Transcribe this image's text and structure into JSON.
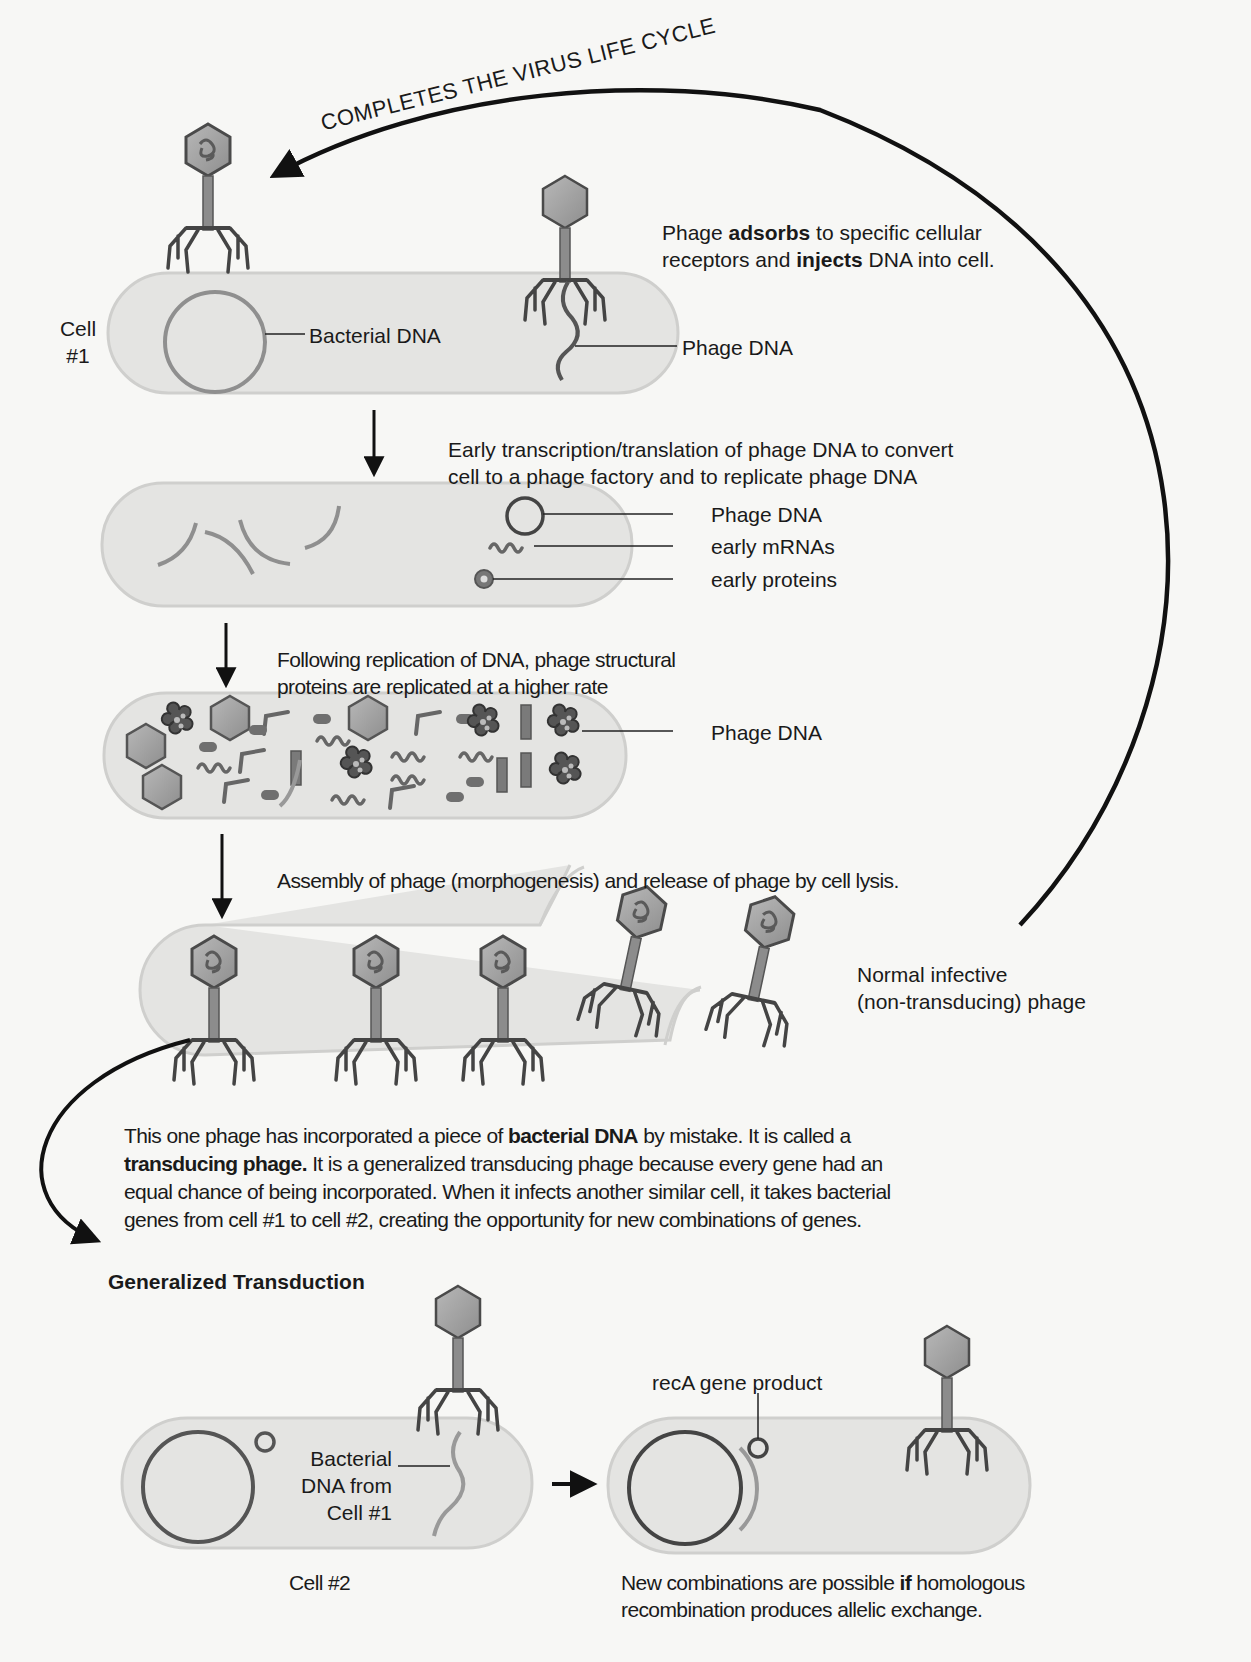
{
  "cycle_arrow_label": "COMPLETES THE VIRUS LIFE CYCLE",
  "cell1_label": {
    "line1": "Cell",
    "line2": "#1"
  },
  "step1": {
    "text_pre": "Phage ",
    "text_bold1": "adsorbs",
    "text_mid": " to specific cellular",
    "line2_pre": "receptors and ",
    "text_bold2": "injects",
    "line2_post": " DNA into cell.",
    "labels": {
      "bacterial_dna": "Bacterial DNA",
      "phage_dna": "Phage DNA"
    }
  },
  "step2": {
    "line1": "Early transcription/translation of phage DNA to convert",
    "line2": "cell to a phage factory and to replicate phage DNA",
    "labels": {
      "phage_dna": "Phage DNA",
      "early_mrnas": "early mRNAs",
      "early_proteins": "early proteins"
    }
  },
  "step3": {
    "line1": "Following replication of DNA, phage structural",
    "line2": "proteins are replicated at a higher rate",
    "labels": {
      "phage_dna": "Phage DNA"
    }
  },
  "step4": {
    "line1": "Assembly of phage (morphogenesis) and release of phage by cell lysis.",
    "labels": {
      "normal_phage_line1": "Normal infective",
      "normal_phage_line2": "(non-transducing) phage"
    }
  },
  "transducing_note": {
    "l1_pre": "This one phage has incorporated a piece of ",
    "l1_bold": "bacterial DNA",
    "l1_post": " by mistake. It is called a",
    "l2_bold": "transducing phage.",
    "l2_post": " It is a generalized transducing phage because every gene had an",
    "l3": "equal chance of being incorporated. When it infects another similar cell, it takes bacterial",
    "l4": "genes from cell #1 to cell #2, creating the opportunity for new combinations of genes."
  },
  "section_title": "Generalized Transduction",
  "cell2": {
    "dna_label": {
      "line1": "Bacterial",
      "line2": "DNA from",
      "line3": "Cell #1"
    },
    "cell_label": "Cell #2",
    "reca_label": "recA gene product",
    "result_pre": "New combinations are possible ",
    "result_bold": "if",
    "result_post": " homologous",
    "result_line2": "recombination produces allelic exchange."
  },
  "colors": {
    "cell_fill": "#e4e4e2",
    "cell_edge": "#cdcdcb",
    "dna_gray": "#8f8f8f",
    "dark": "#4a4a4a",
    "ink": "#111111"
  }
}
